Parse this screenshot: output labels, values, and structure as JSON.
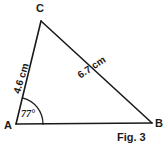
{
  "figure": {
    "caption": "Fig. 3",
    "background_color": "#ffffff",
    "stroke_color": "#1a1a1a",
    "shape": "triangle",
    "vertices": {
      "a": {
        "label": "A",
        "x": 16,
        "y": 124
      },
      "b": {
        "label": "B",
        "x": 152,
        "y": 123
      },
      "c": {
        "label": "C",
        "x": 41,
        "y": 21
      }
    },
    "sides": [
      {
        "name": "ac",
        "label": "4.6 cm",
        "from": "A",
        "to": "C",
        "rotation_deg": -73
      },
      {
        "name": "cb",
        "label": "6.7 cm",
        "from": "C",
        "to": "B",
        "rotation_deg": -34
      },
      {
        "name": "ab",
        "label": "",
        "from": "A",
        "to": "B",
        "rotation_deg": 0
      }
    ],
    "angles": [
      {
        "at": "A",
        "label": "77°",
        "arc_radius": 27
      }
    ]
  }
}
